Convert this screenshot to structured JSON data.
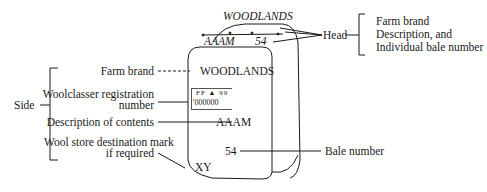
{
  "head": {
    "top_brand": "WOODLANDS",
    "description": "AAAM",
    "bale_number": "54",
    "label": "Head",
    "bracket_items": [
      "Farm brand",
      "Description, and",
      "Individual bale number"
    ]
  },
  "side": {
    "label": "Side",
    "annotations": {
      "farm_brand": "Farm brand",
      "woolclasser_line1": "Woolclasser registration",
      "woolclasser_line2": "number",
      "description": "Description of contents",
      "destination_line1": "Wool store destination mark",
      "destination_line2": "if required"
    },
    "bale_values": {
      "farm_brand": "WOODLANDS",
      "stencil_top": "FF ▲ 99",
      "stencil_bottom": "'000000",
      "description": "AAAM",
      "destination": "XY",
      "bale_number": "54"
    },
    "bale_number_label": "Bale number"
  },
  "colors": {
    "ink": "#1a1a1a",
    "background": "#ffffff"
  }
}
